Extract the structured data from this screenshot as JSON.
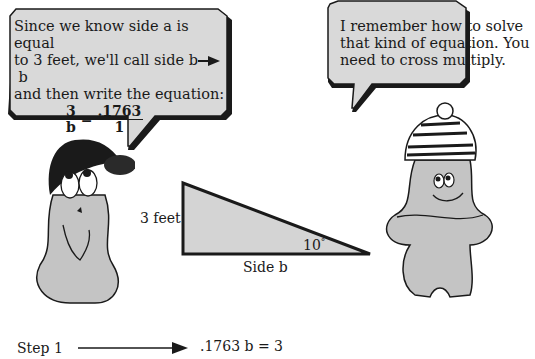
{
  "left_bubble": {
    "lines": [
      "Since we know side a is equal",
      "to 3 feet, we'll call side b",
      "and then write the equation:"
    ],
    "arrow_target": "b",
    "equation": {
      "left_num": "3",
      "left_den": "b",
      "equals": "=",
      "right_num": ".1763",
      "right_den": "1"
    }
  },
  "right_bubble": {
    "lines": [
      "I remember how to solve",
      "that kind of equation. You",
      "need to cross multiply."
    ]
  },
  "triangle": {
    "side_a_label": "3 feet",
    "side_b_label": "Side b",
    "angle_label": "10",
    "angle_unit": "°"
  },
  "step": {
    "label": "Step 1",
    "result": ".1763 b = 3"
  },
  "colors": {
    "bubble_fill": "#d9d9d9",
    "character_fill": "#c4c4c4",
    "triangle_fill": "#d4d4d4",
    "outline": "#1a1a1a"
  }
}
